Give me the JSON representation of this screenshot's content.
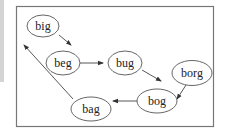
{
  "diagram": {
    "type": "state-graph",
    "nodes": [
      {
        "id": "big",
        "label": "big"
      },
      {
        "id": "beg",
        "label": "beg"
      },
      {
        "id": "bug",
        "label": "bug"
      },
      {
        "id": "borg",
        "label": "borg"
      },
      {
        "id": "bog",
        "label": "bog"
      },
      {
        "id": "bag",
        "label": "bag"
      }
    ],
    "edges": [
      {
        "from": "big",
        "to": "beg"
      },
      {
        "from": "beg",
        "to": "bug"
      },
      {
        "from": "bug",
        "to": "bog"
      },
      {
        "from": "borg",
        "to": "bog"
      },
      {
        "from": "bog",
        "to": "bag"
      },
      {
        "from": "bag",
        "to": "big"
      }
    ]
  }
}
